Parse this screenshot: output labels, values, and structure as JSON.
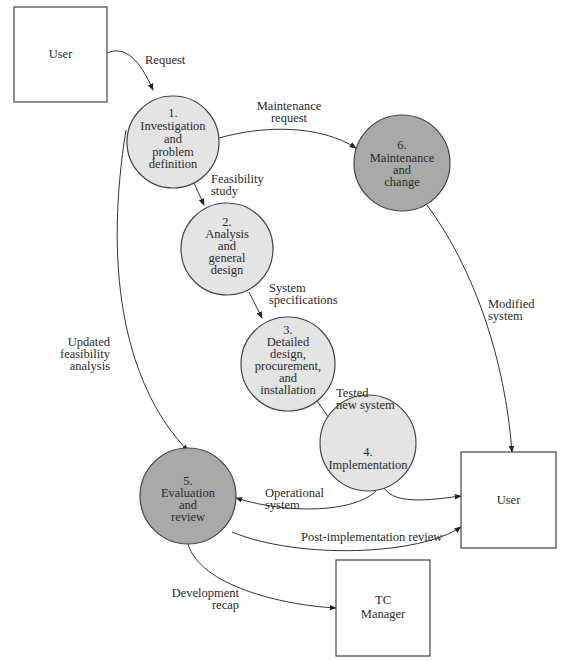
{
  "diagram": {
    "type": "data-flow-diagram",
    "colors": {
      "process_light": "#e4e4e4",
      "process_dark": "#a9a9a9",
      "stroke": "#444444",
      "box_fill": "#ffffff"
    },
    "entities": [
      {
        "id": "user-top",
        "label": "User"
      },
      {
        "id": "user-right",
        "label": "User"
      },
      {
        "id": "tc-manager",
        "label_line1": "TC",
        "label_line2": "Manager"
      }
    ],
    "processes": [
      {
        "id": "p1",
        "number": "1.",
        "lines": [
          "Investigation",
          "and",
          "problem",
          "definition"
        ],
        "shade": "light"
      },
      {
        "id": "p2",
        "number": "2.",
        "lines": [
          "Analysis",
          "and",
          "general",
          "design"
        ],
        "shade": "light"
      },
      {
        "id": "p3",
        "number": "3.",
        "lines": [
          "Detailed",
          "design,",
          "procurement,",
          "and",
          "installation"
        ],
        "shade": "light"
      },
      {
        "id": "p4",
        "number": "4.",
        "lines": [
          "Implementation"
        ],
        "shade": "light"
      },
      {
        "id": "p5",
        "number": "5.",
        "lines": [
          "Evaluation",
          "and",
          "review"
        ],
        "shade": "dark"
      },
      {
        "id": "p6",
        "number": "6.",
        "lines": [
          "Maintenance",
          "and",
          "change"
        ],
        "shade": "dark"
      }
    ],
    "flows": [
      {
        "id": "f-request",
        "from": "user-top",
        "to": "p1",
        "lines": [
          "Request"
        ]
      },
      {
        "id": "f-maintenance-request",
        "from": "p1",
        "to": "p6",
        "lines": [
          "Maintenance",
          "request"
        ]
      },
      {
        "id": "f-feasibility-study",
        "from": "p1",
        "to": "p2",
        "lines": [
          "Feasibility",
          "study"
        ]
      },
      {
        "id": "f-system-specifications",
        "from": "p2",
        "to": "p3",
        "lines": [
          "System",
          "specifications"
        ]
      },
      {
        "id": "f-tested-new-system",
        "from": "p3",
        "to": "p4",
        "lines": [
          "Tested",
          "new system"
        ]
      },
      {
        "id": "f-updated-feasibility",
        "from": "p1",
        "to": "p5",
        "lines": [
          "Updated",
          "feasibility",
          "analysis"
        ]
      },
      {
        "id": "f-modified-system",
        "from": "p6",
        "to": "user-right",
        "lines": [
          "Modified",
          "system"
        ]
      },
      {
        "id": "f-operational-system",
        "from": "p4",
        "to": "p5",
        "lines": [
          "Operational",
          "system"
        ]
      },
      {
        "id": "f-p4-user",
        "from": "p4",
        "to": "user-right",
        "lines": []
      },
      {
        "id": "f-post-implementation",
        "from": "p5",
        "to": "user-right",
        "lines": [
          "Post-implementation review"
        ]
      },
      {
        "id": "f-development-recap",
        "from": "p5",
        "to": "tc-manager",
        "lines": [
          "Development",
          "recap"
        ]
      }
    ]
  }
}
